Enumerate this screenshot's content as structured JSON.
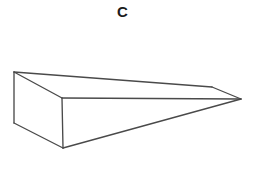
{
  "figure": {
    "label": "C",
    "shape_name": "triangular-wedge",
    "colors": {
      "background": "#ffffff",
      "edge_stroke": "#4a4a4a",
      "face_fill": "#ffffff",
      "label_color": "#1b1b1b"
    },
    "vertices": {
      "top_left_back": [
        14,
        72
      ],
      "bottom_left_back": [
        14,
        123
      ],
      "front_top_middle": [
        62,
        98
      ],
      "front_bottom_middle": [
        63,
        148
      ],
      "back_top_right": [
        212,
        87
      ],
      "right_tip": [
        241,
        99
      ]
    },
    "faces": [
      {
        "name": "top-slanted-face",
        "points": "14,72 212,87 241,99 62,98"
      },
      {
        "name": "left-end-face",
        "points": "14,72 62,98 63,148 14,123"
      },
      {
        "name": "front-triangular-face",
        "points": "62,98 241,99 63,148"
      }
    ],
    "edges": [
      {
        "name": "left-vertical-edge",
        "d": "M14,72 L14,123"
      },
      {
        "name": "top-back-long-edge",
        "d": "M14,72 L212,87"
      },
      {
        "name": "back-tip-edge",
        "d": "M212,87 L241,99"
      },
      {
        "name": "top-diagonal-edge",
        "d": "M14,72 L62,98"
      },
      {
        "name": "middle-horizontal-edge",
        "d": "M62,98 L241,99"
      },
      {
        "name": "front-vertical-edge",
        "d": "M62,98 L63,148"
      },
      {
        "name": "bottom-left-edge",
        "d": "M14,123 L63,148"
      },
      {
        "name": "bottom-long-edge",
        "d": "M63,148 L241,99"
      }
    ]
  }
}
